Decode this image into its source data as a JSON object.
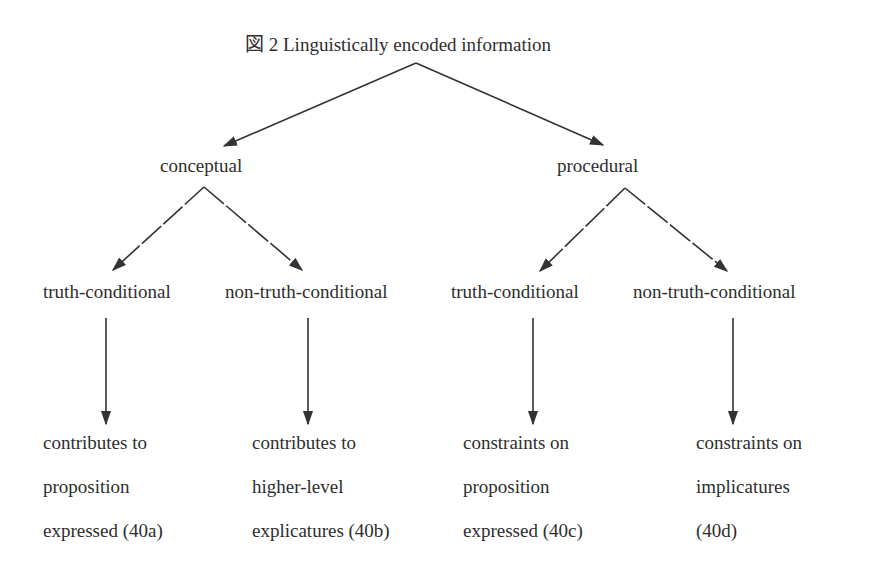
{
  "figure": {
    "title": "図 2  Linguistically encoded information",
    "colors": {
      "text": "#2e2e2e",
      "line": "#333333",
      "background": "#ffffff"
    }
  },
  "level1": {
    "conceptual": "conceptual",
    "procedural": "procedural"
  },
  "level2": {
    "c_truth": "truth-conditional",
    "c_nontruth": "non-truth-conditional",
    "p_truth": "truth-conditional",
    "p_nontruth": "non-truth-conditional"
  },
  "leaves": {
    "a": {
      "line1": "contributes to",
      "line2": "proposition",
      "line3": "expressed (40a)"
    },
    "b": {
      "line1": "contributes to",
      "line2": "higher-level",
      "line3": "explicatures (40b)"
    },
    "c": {
      "line1": "constraints on",
      "line2": "proposition",
      "line3": "expressed (40c)"
    },
    "d": {
      "line1": "constraints on",
      "line2": "implicatures",
      "line3": "(40d)"
    }
  }
}
